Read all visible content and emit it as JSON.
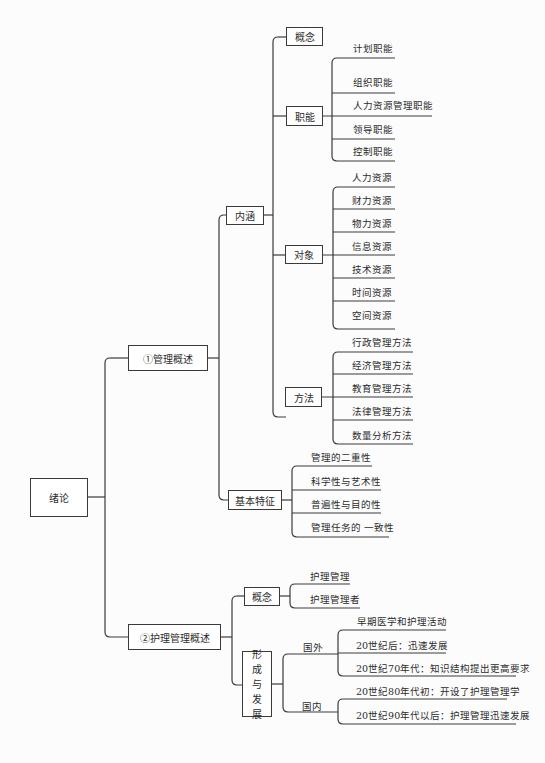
{
  "root": {
    "label": "绪论"
  },
  "branches": [
    {
      "label": "①管理概述",
      "children": [
        {
          "label": "内涵",
          "children": [
            {
              "label": "概念",
              "items": []
            },
            {
              "label": "职能",
              "items": [
                "计划职能",
                "组织职能",
                "人力资源管理职能",
                "领导职能",
                "控制职能"
              ]
            },
            {
              "label": "对象",
              "items": [
                "人力资源",
                "财力资源",
                "物力资源",
                "信息资源",
                "技术资源",
                "时间资源",
                "空间资源"
              ]
            },
            {
              "label": "方法",
              "items": [
                "行政管理方法",
                "经济管理方法",
                "教育管理方法",
                "法律管理方法",
                "数量分析方法"
              ]
            }
          ]
        },
        {
          "label": "基本特征",
          "items": [
            "管理的二重性",
            "科学性与艺术性",
            "普遍性与目的性",
            "管理任务的 一致性"
          ]
        }
      ]
    },
    {
      "label": "②护理管理概述",
      "children": [
        {
          "label": "概念",
          "items": [
            "护理管理",
            "护理管理者"
          ]
        },
        {
          "label": "形成与发展",
          "label_chars": [
            "形",
            "成",
            "与",
            "发",
            "展"
          ],
          "groups": [
            {
              "label": "国外",
              "items": [
                "早期医学和护理活动",
                "20世纪后：迅速发展",
                "20世纪70年代：知识结构提出更高要求"
              ]
            },
            {
              "label": "国内",
              "items": [
                "20世纪80年代初：开设了护理管理学",
                "20世纪90年代以后：护理管理迅速发展"
              ]
            }
          ]
        }
      ]
    }
  ]
}
